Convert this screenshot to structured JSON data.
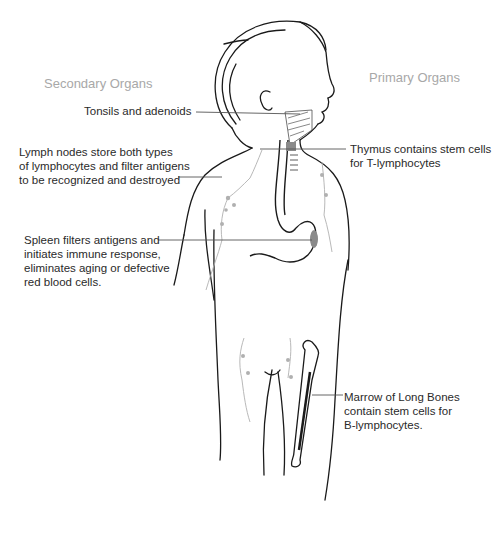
{
  "diagram": {
    "type": "anatomical-illustration",
    "headings": {
      "secondary": "Secondary Organs",
      "primary": "Primary Organs"
    },
    "labels": {
      "tonsils": [
        "Tonsils and adenoids"
      ],
      "lymph_nodes": [
        "Lymph nodes store both types",
        "of lymphocytes and filter antigens",
        "to be recognized and destroyed"
      ],
      "spleen": [
        "Spleen filters antigens and",
        "initiates immune response,",
        "eliminates aging or defective",
        "red blood cells."
      ],
      "thymus": [
        "Thymus contains stem cells",
        "for T-lymphocytes"
      ],
      "marrow": [
        "Marrow of Long Bones",
        "contain stem cells for",
        "B-lymphocytes."
      ]
    },
    "colors": {
      "outline": "#1a1a1a",
      "lymph": "#b0b0b0",
      "organ_fill": "#8a8a8a",
      "heading": "#a8a8a8",
      "label_text": "#2a2a2a",
      "leader_line": "#555555"
    }
  }
}
